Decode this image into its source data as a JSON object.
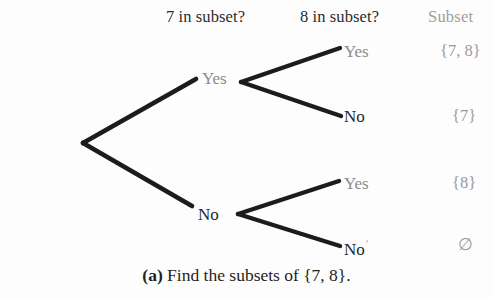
{
  "figure": {
    "caption_tag": "(a)",
    "caption_text": "Find the subsets of {7, 8}.",
    "background_color": "#fdfdfd",
    "line_color": "#1c1c1c",
    "dark_text_color": "#262626",
    "gray_text_color": "#8f8f8f"
  },
  "headers": {
    "question_1": "7 in subset?",
    "question_2": "8 in subset?",
    "result_column": "Subset"
  },
  "tree": {
    "root": {
      "x": 82,
      "y": 142
    },
    "level1": [
      {
        "id": "yes-1",
        "label": "Yes",
        "color": "gray",
        "branch_vertex_x": 240,
        "branch_vertex_y": 82
      },
      {
        "id": "no-1",
        "label": "No",
        "color": "dark",
        "branch_vertex_x": 238,
        "branch_vertex_y": 214
      }
    ],
    "leaves": [
      {
        "id": "yes-1-yes",
        "label": "Yes",
        "color": "gray",
        "result": "{7, 8}"
      },
      {
        "id": "yes-1-no",
        "label": "No",
        "color": "dark",
        "result": "{7}"
      },
      {
        "id": "no-1-yes",
        "label": "Yes",
        "color": "gray",
        "result": "{8}"
      },
      {
        "id": "no-1-no",
        "label": "No",
        "color": "dark",
        "result": "∅",
        "artifact_tick": "’"
      }
    ]
  }
}
